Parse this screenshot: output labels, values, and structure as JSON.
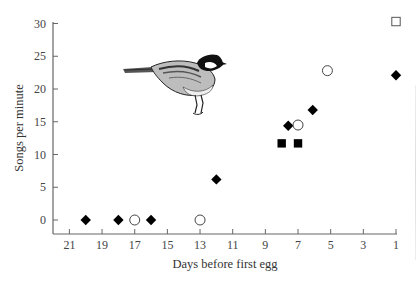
{
  "chart_data": {
    "type": "scatter",
    "title": "",
    "xlabel": "Days before first egg",
    "ylabel": "Songs per minute",
    "xlim": [
      22,
      1
    ],
    "ylim": [
      -2,
      30
    ],
    "x_reversed": true,
    "x_ticks": [
      21,
      19,
      17,
      15,
      13,
      11,
      9,
      7,
      5,
      3,
      1
    ],
    "y_ticks": [
      0,
      5,
      10,
      15,
      20,
      25,
      30
    ],
    "grid": false,
    "legend": null,
    "annotations": [
      "bird illustration (tit) in upper-left plot area"
    ],
    "series": [
      {
        "name": "filled-diamond",
        "marker": "diamond",
        "fill": "#000000",
        "points": [
          {
            "x": 20,
            "y": 0
          },
          {
            "x": 18,
            "y": 0
          },
          {
            "x": 16,
            "y": 0
          },
          {
            "x": 12,
            "y": 6.2
          },
          {
            "x": 7.6,
            "y": 14.4
          },
          {
            "x": 6.1,
            "y": 16.8
          },
          {
            "x": 1,
            "y": 22.1
          }
        ]
      },
      {
        "name": "open-circle",
        "marker": "circle",
        "fill": "none",
        "points": [
          {
            "x": 17,
            "y": 0
          },
          {
            "x": 13,
            "y": 0
          },
          {
            "x": 7,
            "y": 14.5
          },
          {
            "x": 5.2,
            "y": 22.8
          }
        ]
      },
      {
        "name": "filled-square",
        "marker": "square",
        "fill": "#000000",
        "points": [
          {
            "x": 8,
            "y": 11.7
          },
          {
            "x": 7,
            "y": 11.7
          }
        ]
      },
      {
        "name": "open-square",
        "marker": "square",
        "fill": "none",
        "points": [
          {
            "x": 1,
            "y": 30.3
          }
        ]
      }
    ]
  },
  "labels": {
    "xlabel": "Days before first egg",
    "ylabel": "Songs per minute"
  }
}
